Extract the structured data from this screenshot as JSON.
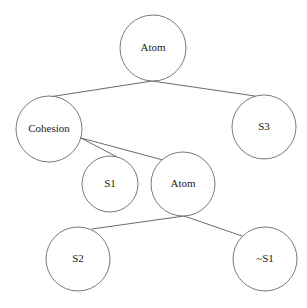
{
  "diagram": {
    "type": "tree",
    "background_color": "#ffffff",
    "node_fill": "#ffffff",
    "node_stroke": "#6a6a6a",
    "edge_color": "#5a5a5a",
    "label_color": "#1c1c1c",
    "nodes": [
      {
        "id": "n0",
        "label": "Atom",
        "cx": 153,
        "cy": 48,
        "r": 33
      },
      {
        "id": "n1",
        "label": "Cohesion",
        "cx": 49,
        "cy": 129,
        "r": 33
      },
      {
        "id": "n2",
        "label": "S3",
        "cx": 264,
        "cy": 127,
        "r": 32
      },
      {
        "id": "n3",
        "label": "S1",
        "cx": 110,
        "cy": 184,
        "r": 28
      },
      {
        "id": "n4",
        "label": "Atom",
        "cx": 183,
        "cy": 184,
        "r": 32
      },
      {
        "id": "n5",
        "label": "S2",
        "cx": 78,
        "cy": 259,
        "r": 32
      },
      {
        "id": "n6",
        "label": "~S1",
        "cx": 265,
        "cy": 259,
        "r": 32
      }
    ],
    "edges": [
      {
        "from": "n0",
        "to": "n1",
        "x1": 152,
        "y1": 81,
        "x2": 49,
        "y2": 97
      },
      {
        "from": "n0",
        "to": "n2",
        "x1": 152,
        "y1": 81,
        "x2": 255,
        "y2": 96
      },
      {
        "from": "n1",
        "to": "n3",
        "x1": 81,
        "y1": 138,
        "x2": 117,
        "y2": 157
      },
      {
        "from": "n1",
        "to": "n4",
        "x1": 81,
        "y1": 138,
        "x2": 163,
        "y2": 160
      },
      {
        "from": "n4",
        "to": "n5",
        "x1": 184,
        "y1": 216,
        "x2": 92,
        "y2": 229
      },
      {
        "from": "n4",
        "to": "n6",
        "x1": 184,
        "y1": 216,
        "x2": 242,
        "y2": 236
      }
    ]
  }
}
